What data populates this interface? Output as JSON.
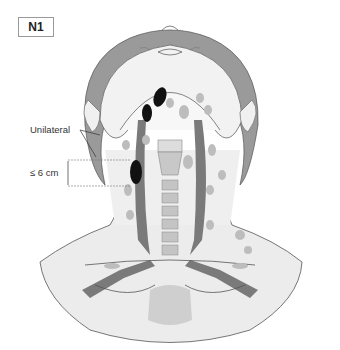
{
  "figure": {
    "stage_label": "N1",
    "annotations": {
      "laterality": "Unilateral",
      "size_limit": "≤ 6 cm"
    },
    "colors": {
      "skin": "#eeeeee",
      "hair": "#9a9a9a",
      "vessel": "#7a7a7a",
      "node_normal": "#bdbdbd",
      "node_metastatic": "#111111",
      "outline": "#555555"
    },
    "metastatic_nodes": [
      {
        "cx": 160,
        "cy": 97,
        "rx": 6,
        "ry": 10
      },
      {
        "cx": 147,
        "cy": 113,
        "rx": 5,
        "ry": 9
      },
      {
        "cx": 136,
        "cy": 172,
        "rx": 6,
        "ry": 12
      }
    ]
  }
}
